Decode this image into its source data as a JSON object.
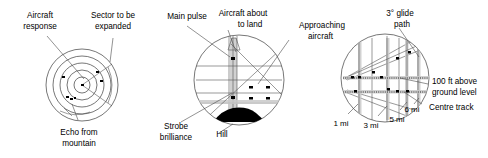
{
  "figure": {
    "background": "#ffffff",
    "line_color": "#3c3c3c",
    "blip_color": "#000000",
    "band_color": "#c9c9c9"
  },
  "panels": [
    {
      "id": "ppi-surveillance",
      "name": "Plan position indicator display",
      "labels": {
        "aircraft_response": "Aircraft\nresponse",
        "aircraft_response_line1": "Aircraft",
        "aircraft_response_line2": "response",
        "sector_line1": "Sector to be",
        "sector_line2": "expanded",
        "echo_line1": "Echo from",
        "echo_line2": "mountain"
      },
      "range_rings": 5,
      "blips": 5
    },
    {
      "id": "height-finder",
      "name": "Height finder / approach display",
      "labels": {
        "main_pulse": "Main pulse",
        "aircraft_landing_line1": "Aircraft about",
        "aircraft_landing_line2": "to land",
        "approaching_line1": "Approaching",
        "approaching_line2": "aircraft",
        "strobe_line1": "Strobe",
        "strobe_line2": "brilliance",
        "hill": "Hill"
      },
      "blips": 6
    },
    {
      "id": "glide-path",
      "name": "Precision approach glide path display",
      "labels": {
        "glide_path_line1": "3° glide",
        "glide_path_line2": "path",
        "altitude_line1": "100 ft above",
        "altitude_line2": "ground level",
        "centre_track": "Centre track",
        "range_1": "1 mi",
        "range_3": "3 mi",
        "range_5": "5 mi",
        "range_6": "6 mi"
      },
      "range_marks": [
        "1 mi",
        "3 mi",
        "5 mi",
        "6 mi"
      ]
    }
  ]
}
